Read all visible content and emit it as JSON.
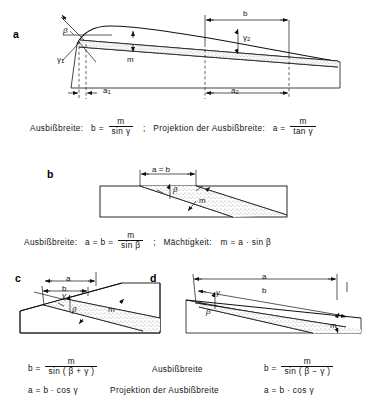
{
  "figure": {
    "title_terms": {
      "outcrop_width": "Ausbißbreite",
      "projection": "Projektion der Ausbißbreite",
      "thickness": "Mächtigkeit"
    },
    "panels": [
      {
        "letter": "a",
        "labels": {
          "beta": "β",
          "gamma1": "γ",
          "gamma1_sub": "1",
          "gamma2": "γ",
          "gamma2_sub": "2",
          "thickness": "m",
          "b": "b",
          "a1": "a",
          "a1_sub": "1",
          "a2": "a",
          "a2_sub": "2"
        },
        "formula": {
          "left_term": "Ausbißbreite:",
          "left_lhs": "b =",
          "left_num": "m",
          "left_den": "sin γ",
          "separator": ";",
          "right_term": "Projektion der Ausbißbreite:",
          "right_lhs": "a =",
          "right_num": "m",
          "right_den": "tan γ"
        }
      },
      {
        "letter": "b",
        "labels": {
          "ab": "a = b",
          "beta": "β",
          "thickness": "m"
        },
        "formula": {
          "left_term": "Ausbißbreite:",
          "left_lhs": "a = b =",
          "left_num": "m",
          "left_den": "sin β",
          "separator": ";",
          "right_term": "Mächtigkeit:",
          "right_rhs": "m = a · sin β"
        }
      },
      {
        "letter": "c",
        "labels": {
          "a": "a",
          "b": "b",
          "beta": "β",
          "gamma": "γ",
          "thickness": "m"
        }
      },
      {
        "letter": "d",
        "labels": {
          "a": "a",
          "b": "b",
          "beta": "β",
          "gamma": "γ",
          "thickness": "m"
        }
      }
    ],
    "bottom_formulas": {
      "row1": {
        "center": "Ausbißbreite",
        "left_lhs": "b =",
        "left_num": "m",
        "left_den": "sin ( β + γ )",
        "right_lhs": "b =",
        "right_num": "m",
        "right_den": "sin ( β − γ )"
      },
      "row2": {
        "center": "Projektion der Ausbißbreite",
        "left": "a = b · cos γ",
        "right": "a = b · cos γ"
      }
    }
  }
}
